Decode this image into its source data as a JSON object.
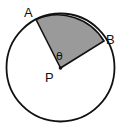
{
  "diagram": {
    "type": "circle-sector",
    "labels": {
      "point_a": "A",
      "point_b": "B",
      "center": "P",
      "angle": "θ"
    },
    "colors": {
      "sector_fill": "#9a9a9a",
      "stroke": "#111111",
      "background": "#ffffff"
    }
  }
}
